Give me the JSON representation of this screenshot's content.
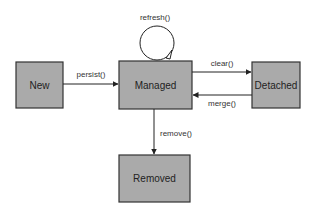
{
  "diagram": {
    "type": "state-diagram",
    "colors": {
      "box_fill": "#aaaaaa",
      "box_stroke": "#333333",
      "edge": "#222222",
      "text": "#222222"
    },
    "nodes": [
      {
        "id": "new",
        "label": "New"
      },
      {
        "id": "managed",
        "label": "Managed"
      },
      {
        "id": "detached",
        "label": "Detached"
      },
      {
        "id": "removed",
        "label": "Removed"
      }
    ],
    "edges": [
      {
        "from": "new",
        "to": "managed",
        "label": "persist()"
      },
      {
        "from": "managed",
        "to": "managed",
        "label": "refresh()"
      },
      {
        "from": "managed",
        "to": "detached",
        "label": "clear()"
      },
      {
        "from": "detached",
        "to": "managed",
        "label": "merge()"
      },
      {
        "from": "managed",
        "to": "removed",
        "label": "remove()"
      }
    ]
  }
}
